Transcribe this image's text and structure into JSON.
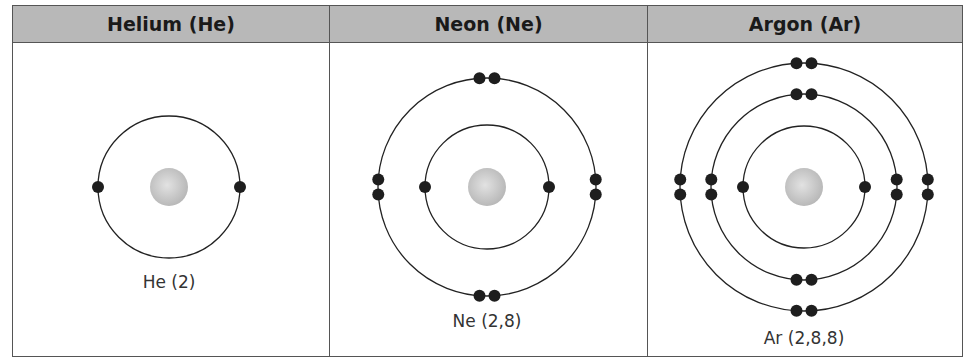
{
  "atoms": [
    {
      "header": "Helium (He)",
      "label": "He (2)",
      "shells": [
        2
      ]
    },
    {
      "header": "Neon (Ne)",
      "label": "Ne (2,8)",
      "shells": [
        2,
        8
      ]
    },
    {
      "header": "Argon (Ar)",
      "label": "Ar (2,8,8)",
      "shells": [
        2,
        8,
        8
      ]
    }
  ],
  "colors": {
    "header_bg": "#b8b8b8",
    "electron": "#1e1e1e",
    "nucleus": "#c8c8c8",
    "orbit": "#222222"
  }
}
